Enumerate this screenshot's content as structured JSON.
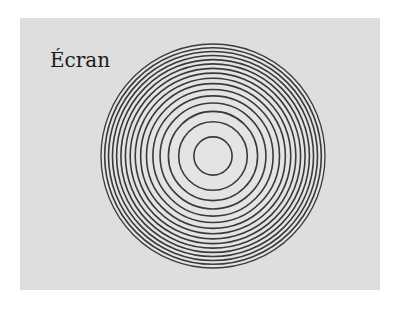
{
  "figure": {
    "label": "Écran",
    "background_color": "#dedede",
    "ring_color": "#3a3a3a",
    "center": [
      213,
      156
    ],
    "outer_radius": 112,
    "ring_count": 16
  }
}
